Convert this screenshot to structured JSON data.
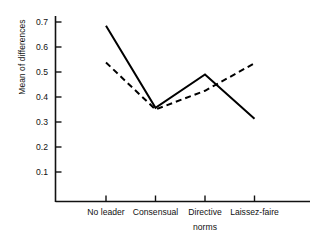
{
  "chart_data": {
    "type": "line",
    "title": "",
    "xlabel": "norms",
    "ylabel": "Mean of differences",
    "categories": [
      "No leader",
      "Consensual",
      "Directive",
      "Laissez-faire"
    ],
    "ylim": [
      0.0,
      0.75
    ],
    "yticks": [
      0.1,
      0.2,
      0.3,
      0.4,
      0.5,
      0.6,
      0.7
    ],
    "ytick_labels": [
      "0.1",
      "0.2",
      "0.3",
      "0.4",
      "0.5",
      "0.6",
      "0.7"
    ],
    "grid": false,
    "legend": "none",
    "series": [
      {
        "name": "solid",
        "style": "solid",
        "color": "#000000",
        "values": [
          0.685,
          0.357,
          0.49,
          0.313
        ]
      },
      {
        "name": "dashed",
        "style": "dashed",
        "color": "#000000",
        "values": [
          0.538,
          0.35,
          0.425,
          0.535
        ]
      }
    ]
  },
  "axes": {
    "y_axis_label": "Mean of differences",
    "x_axis_label": "norms"
  }
}
